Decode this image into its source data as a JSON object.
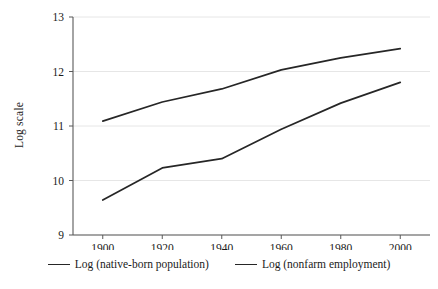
{
  "chart_data": {
    "type": "line",
    "title": "",
    "subtitle": "",
    "xlabel": "",
    "ylabel": "Log scale",
    "x": [
      1900,
      1920,
      1940,
      1960,
      1980,
      2000
    ],
    "xtick_labels": [
      "1900",
      "1920",
      "1940",
      "1960",
      "1980",
      "2000"
    ],
    "ytick_labels": [
      "9",
      "10",
      "11",
      "12",
      "13"
    ],
    "yticks": [
      9,
      10,
      11,
      12,
      13
    ],
    "xlim": [
      1890,
      2010
    ],
    "ylim": [
      9,
      13
    ],
    "grid": "horizontal",
    "legend_position": "bottom-center",
    "series": [
      {
        "name": "Log (native-born population)",
        "color": "#262626",
        "values": [
          11.09,
          11.44,
          11.68,
          12.03,
          12.25,
          12.42
        ]
      },
      {
        "name": "Log (nonfarm employment)",
        "color": "#262626",
        "values": [
          9.64,
          10.23,
          10.4,
          10.94,
          11.42,
          11.8
        ]
      }
    ]
  },
  "axes": {
    "y_axis_title": "Log scale"
  },
  "colors": {
    "line": "#262626",
    "axis": "#595959",
    "grid": "#e6e6e6",
    "background": "#ffffff"
  }
}
